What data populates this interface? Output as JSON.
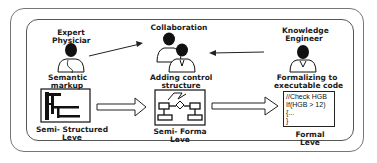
{
  "roles": {
    "expert": {
      "line1": "Expert",
      "line2": "Physiciar"
    },
    "collaboration": {
      "label": "Collaboration"
    },
    "engineer": {
      "line1": "Knowledge",
      "line2": "Engineer"
    }
  },
  "steps": {
    "semantic": {
      "line1": "Semantic",
      "line2": "markup"
    },
    "control": {
      "line1": "Adding control",
      "line2": "structure"
    },
    "formalizing": {
      "line1": "Formalizing to",
      "line2": "executable code"
    }
  },
  "levels": {
    "semi_structured": {
      "line1": "Semi- Structured",
      "line2": "Leve"
    },
    "semi_formal": {
      "line1": "Semi- Forma",
      "line2": "Leve"
    },
    "formal": {
      "line1": "Formal",
      "line2": "Leve"
    }
  },
  "code": {
    "lines": [
      "//Check HGB",
      "If(HGB > 12)",
      "{...",
      "}"
    ]
  }
}
